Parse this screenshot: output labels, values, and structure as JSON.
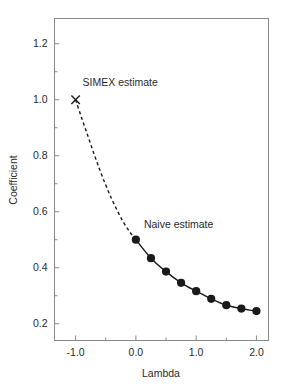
{
  "chart_data": {
    "type": "line",
    "title": "",
    "subtitle": "",
    "xlabel": "Lambda",
    "ylabel": "Coefficient",
    "xlim": [
      -1.35,
      2.2
    ],
    "ylim": [
      0.14,
      1.29
    ],
    "grid": false,
    "legend_position": "none",
    "xticks": [
      -1.0,
      0.0,
      1.0,
      2.0
    ],
    "xticklabels": [
      "-1.0",
      "0.0",
      "1.0",
      "2.0"
    ],
    "xticks_minor": [
      -0.5,
      0.5,
      1.5
    ],
    "yticks": [
      0.2,
      0.4,
      0.6,
      0.8,
      1.0,
      1.2
    ],
    "yticklabels": [
      "0.2",
      "0.4",
      "0.6",
      "0.8",
      "1.0",
      "1.2"
    ],
    "yticks_minor": [
      0.3,
      0.5,
      0.7,
      0.9,
      1.1
    ],
    "series": [
      {
        "name": "simex-fit-observed",
        "style": "solid-with-markers",
        "color": "#1a1a1a",
        "marker": "filled-circle",
        "x": [
          0.0,
          0.25,
          0.5,
          0.75,
          1.0,
          1.25,
          1.5,
          1.75,
          2.0
        ],
        "y": [
          0.5,
          0.434,
          0.386,
          0.346,
          0.316,
          0.289,
          0.266,
          0.254,
          0.245
        ]
      },
      {
        "name": "simex-extrapolation",
        "style": "dashed",
        "color": "#1a1a1a",
        "marker": "none",
        "x": [
          -1.0,
          -0.9,
          -0.8,
          -0.7,
          -0.6,
          -0.5,
          -0.4,
          -0.3,
          -0.2,
          -0.1,
          0.0
        ],
        "y": [
          1.0,
          0.935,
          0.873,
          0.81,
          0.75,
          0.695,
          0.645,
          0.6,
          0.56,
          0.527,
          0.5
        ]
      }
    ],
    "points": [
      {
        "name": "simex-estimate-point",
        "marker": "x-cross",
        "x": -1.0,
        "y": 1.0,
        "color": "#1a1a1a"
      }
    ],
    "annotations": [
      {
        "name": "simex-estimate-annotation",
        "text": "SIMEX estimate",
        "x": -1.0,
        "y": 1.0,
        "dx": 7,
        "dy": -14,
        "anchor": "start"
      },
      {
        "name": "naive-estimate-annotation",
        "text": "Naive estimate",
        "x": 0.0,
        "y": 0.5,
        "dx": 8,
        "dy": -12,
        "anchor": "start"
      }
    ],
    "colors": {
      "axis": "#8a8a8a",
      "curve": "#1a1a1a",
      "marker_fill": "#1a1a1a",
      "text": "#2b2b2b",
      "background": "#ffffff"
    }
  }
}
